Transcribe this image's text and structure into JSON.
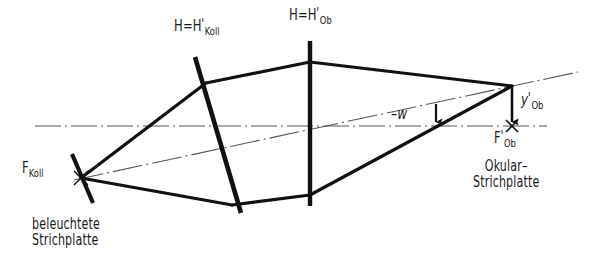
{
  "figure": {
    "background_color": "#ffffff",
    "line_color": "#111111",
    "axis_color": "#555555"
  },
  "labels": {
    "principal_plane_collimator": {
      "base": "H=H",
      "prime": "'",
      "sub": "Koll"
    },
    "principal_plane_objective": {
      "base": "H=H",
      "prime": "'",
      "sub": "Ob"
    },
    "focal_point_collimator": {
      "base": "F",
      "sub": "Koll"
    },
    "image_height": {
      "base": "y",
      "prime": "'",
      "sub": "Ob"
    },
    "focal_point_objective_image": {
      "base": "F",
      "prime": "'",
      "sub": "Ob"
    },
    "field_angle": "–w",
    "source_plate_line1": "beleuchtete",
    "source_plate_line2": "Strichplatte",
    "eyepiece_plate_line1": "Okular–",
    "eyepiece_plate_line2": "Strichplatte"
  },
  "geometry": {
    "optical_axis": {
      "x1": 35,
      "y1": 126,
      "x2": 547,
      "y2": 126
    },
    "chief_ray": {
      "x1": 74,
      "y1": 180,
      "x2": 578,
      "y2": 72
    },
    "collimator_plate": {
      "x1": 72,
      "y1": 154,
      "x2": 93,
      "y2": 203
    },
    "principal_plane_koll": {
      "x1": 195,
      "y1": 57,
      "x2": 241,
      "y2": 213
    },
    "principal_plane_ob": {
      "x1": 310,
      "y1": 41,
      "x2": 310,
      "y2": 206
    },
    "focal_cross_left": {
      "x": 81,
      "y": 178
    },
    "focal_cross_right": {
      "x": 512,
      "y": 126
    },
    "image_point": {
      "x": 512,
      "y": 86
    },
    "rays": [
      {
        "name": "upper-ray-left",
        "x1": 81,
        "y1": 178,
        "x2": 206,
        "y2": 83
      },
      {
        "name": "lower-ray-left",
        "x1": 81,
        "y1": 178,
        "x2": 232,
        "y2": 205
      },
      {
        "name": "upper-ray-middle",
        "x1": 206,
        "y1": 83,
        "x2": 310,
        "y2": 62
      },
      {
        "name": "lower-ray-middle",
        "x1": 232,
        "y1": 205,
        "x2": 310,
        "y2": 195
      },
      {
        "name": "upper-ray-right",
        "x1": 310,
        "y1": 62,
        "x2": 512,
        "y2": 86
      },
      {
        "name": "lower-ray-right",
        "x1": 310,
        "y1": 195,
        "x2": 512,
        "y2": 86
      }
    ],
    "image_height_arrow": {
      "x": 512,
      "y1": 86,
      "y2": 126
    },
    "angle_arrow": {
      "x": 436,
      "y1": 106,
      "y2": 126
    }
  }
}
